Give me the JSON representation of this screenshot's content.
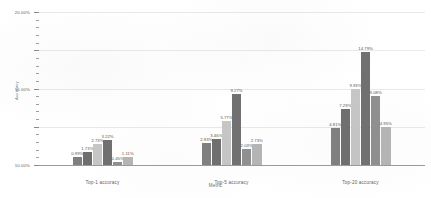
{
  "chart_data": {
    "type": "bar",
    "title": "",
    "xlabel": "Metric",
    "ylabel": "Accuracy",
    "ylim": [
      0,
      20
    ],
    "ytick_labels": [
      "0.00%",
      "5.00%",
      "10.00%",
      "15.00%",
      "20.00%"
    ],
    "ytick_values": [
      0,
      5,
      10,
      15,
      20
    ],
    "grid": true,
    "legend": "none",
    "categories": [
      "Top-1 accuracy",
      "Top-5 accuracy",
      "Top-20 accuracy"
    ],
    "series": [
      {
        "name": "series-1",
        "color": "#7f7f7f",
        "values": [
          0.99,
          2.93,
          4.81
        ],
        "labels": [
          "0.99%",
          "2.93%",
          "4.81%"
        ]
      },
      {
        "name": "series-2",
        "color": "#6e6e6e",
        "values": [
          1.73,
          3.46,
          7.29
        ],
        "labels": [
          "1.73%",
          "3.46%",
          "7.29%"
        ]
      },
      {
        "name": "series-3",
        "color": "#c6c6c6",
        "values": [
          2.73,
          5.77,
          9.93
        ],
        "labels": [
          "2.73%",
          "5.77%",
          "9.93%"
        ]
      },
      {
        "name": "series-4",
        "color": "#707070",
        "values": [
          3.22,
          9.27,
          14.79
        ],
        "labels": [
          "3.22%",
          "9.27%",
          "14.79%"
        ]
      },
      {
        "name": "series-5",
        "color": "#8f8f8f",
        "values": [
          0.45,
          2.03,
          9.08
        ],
        "labels": [
          "0.45%",
          "2.03%",
          "9.08%"
        ]
      },
      {
        "name": "series-6",
        "color": "#b5b5b5",
        "values": [
          1.11,
          2.73,
          4.95
        ],
        "labels": [
          "1.11%",
          "2.73%",
          "4.95%"
        ]
      }
    ]
  },
  "axes": {
    "y_title": "Accuracy",
    "x_title": "Metric"
  }
}
